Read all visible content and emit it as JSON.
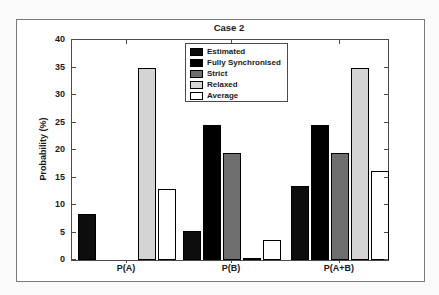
{
  "figure": {
    "title": "Case 2",
    "frame_border_color": "#7a7a7a",
    "axis_color": "#4a4a4a",
    "background_color": "#ffffff"
  },
  "chart_data": {
    "type": "bar",
    "title": "Case 2",
    "xlabel": "",
    "ylabel": "Probability (%)",
    "categories": [
      "P(A)",
      "P(B)",
      "P(A+B)"
    ],
    "series": [
      {
        "name": "Estimated",
        "color": "#0d0d0d",
        "values": [
          8.4,
          5.3,
          13.4
        ]
      },
      {
        "name": "Fully Synchronised",
        "color": "#000000",
        "values": [
          0,
          24.6,
          24.6
        ]
      },
      {
        "name": "Strict",
        "color": "#6e6e6e",
        "values": [
          0,
          19.4,
          19.4
        ]
      },
      {
        "name": "Relaxed",
        "color": "#d4d4d4",
        "values": [
          34.9,
          0.2,
          34.9
        ]
      },
      {
        "name": "Average",
        "color": "#ffffff",
        "values": [
          13.0,
          3.6,
          16.1
        ]
      }
    ],
    "ylim": [
      0,
      40
    ],
    "yticks": [
      0,
      5,
      10,
      15,
      20,
      25,
      30,
      35,
      40
    ],
    "grid": false,
    "legend_position": "upper center-left inside plot",
    "legend_entries": [
      "Estimated",
      "Fully Synchronised",
      "Strict",
      "Relaxed",
      "Average"
    ]
  }
}
